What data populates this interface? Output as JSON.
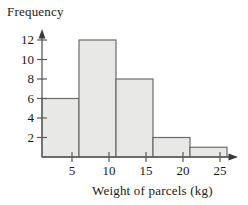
{
  "chart_data": {
    "type": "bar",
    "title": "",
    "ylabel": "Frequency",
    "xlabel": "Weight of parcels (kg)",
    "categories": [
      "0-5",
      "5-10",
      "10-15",
      "15-20",
      "20-25"
    ],
    "bin_edges": [
      0,
      5,
      10,
      15,
      20,
      25
    ],
    "values": [
      6,
      12,
      8,
      2,
      1
    ],
    "xlim": [
      0,
      25
    ],
    "ylim": [
      0,
      13
    ],
    "xticks": [
      5,
      10,
      15,
      20,
      25
    ],
    "xtick_labels": [
      "5",
      "10",
      "15",
      "20",
      "25"
    ],
    "yticks": [
      2,
      4,
      6,
      8,
      10,
      12
    ],
    "ytick_labels": [
      "2",
      "4",
      "6",
      "8",
      "10",
      "12"
    ],
    "grid": false,
    "legend": false,
    "bar_fill_color": "#e8e8e6",
    "bar_edge_color": "#6b6b6b",
    "axis_color": "#5a5a5a",
    "axis_arrows": true
  },
  "axes": {
    "y_title": "Frequency",
    "x_title": "Weight of parcels (kg)"
  },
  "ylabels": {
    "t12": "12",
    "t10": "10",
    "t8": "8",
    "t6": "6",
    "t4": "4",
    "t2": "2"
  },
  "xlabels": {
    "t5": "5",
    "t10": "10",
    "t15": "15",
    "t20": "20",
    "t25": "25"
  }
}
